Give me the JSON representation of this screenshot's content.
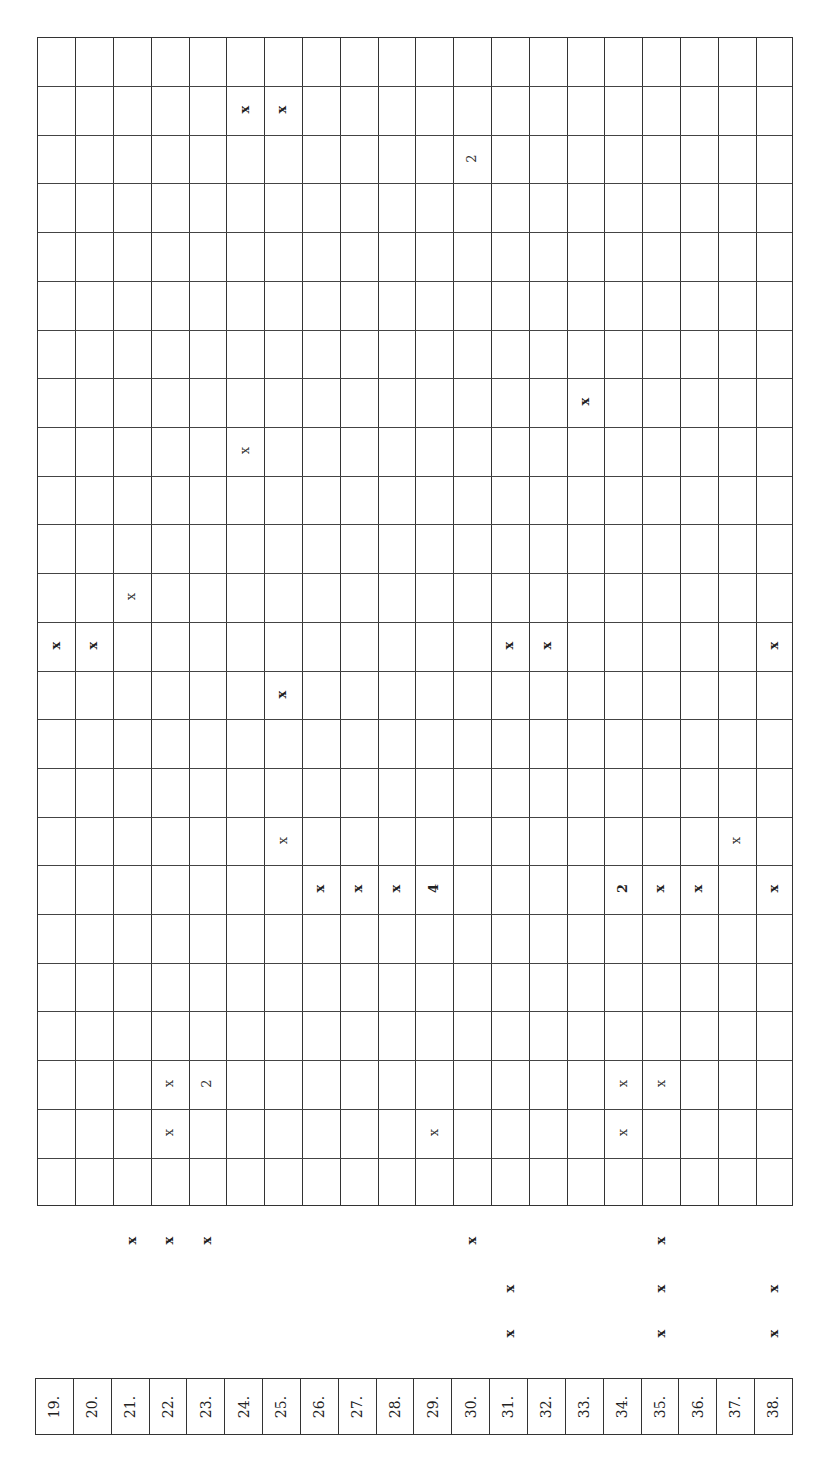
{
  "table": {
    "rows": 24,
    "columns": 20,
    "column_labels": [
      "19.",
      "20.",
      "21.",
      "22.",
      "23.",
      "24.",
      "25.",
      "26.",
      "27.",
      "28.",
      "29.",
      "30.",
      "31.",
      "32.",
      "33.",
      "34.",
      "35.",
      "36.",
      "37.",
      "38."
    ],
    "grid_marks": [
      {
        "row": 1,
        "col": 5,
        "text": "x",
        "weight": "bold"
      },
      {
        "row": 1,
        "col": 6,
        "text": "x",
        "weight": "bold"
      },
      {
        "row": 2,
        "col": 11,
        "text": "2",
        "weight": "light"
      },
      {
        "row": 7,
        "col": 14,
        "text": "x",
        "weight": "bold"
      },
      {
        "row": 8,
        "col": 5,
        "text": "x",
        "weight": "light"
      },
      {
        "row": 11,
        "col": 2,
        "text": "x",
        "weight": "light"
      },
      {
        "row": 12,
        "col": 0,
        "text": "x",
        "weight": "bold"
      },
      {
        "row": 12,
        "col": 1,
        "text": "x",
        "weight": "bold"
      },
      {
        "row": 12,
        "col": 12,
        "text": "x",
        "weight": "bold"
      },
      {
        "row": 12,
        "col": 13,
        "text": "x",
        "weight": "bold"
      },
      {
        "row": 12,
        "col": 19,
        "text": "x",
        "weight": "bold"
      },
      {
        "row": 13,
        "col": 6,
        "text": "x",
        "weight": "bold"
      },
      {
        "row": 16,
        "col": 6,
        "text": "x",
        "weight": "light"
      },
      {
        "row": 16,
        "col": 18,
        "text": "x",
        "weight": "light"
      },
      {
        "row": 17,
        "col": 7,
        "text": "x",
        "weight": "bold"
      },
      {
        "row": 17,
        "col": 8,
        "text": "x",
        "weight": "bold"
      },
      {
        "row": 17,
        "col": 9,
        "text": "x",
        "weight": "bold"
      },
      {
        "row": 17,
        "col": 10,
        "text": "4",
        "weight": "bold"
      },
      {
        "row": 17,
        "col": 15,
        "text": "2",
        "weight": "bold"
      },
      {
        "row": 17,
        "col": 16,
        "text": "x",
        "weight": "bold"
      },
      {
        "row": 17,
        "col": 17,
        "text": "x",
        "weight": "bold"
      },
      {
        "row": 17,
        "col": 19,
        "text": "x",
        "weight": "bold"
      },
      {
        "row": 21,
        "col": 3,
        "text": "x",
        "weight": "light"
      },
      {
        "row": 21,
        "col": 4,
        "text": "2",
        "weight": "light"
      },
      {
        "row": 21,
        "col": 15,
        "text": "x",
        "weight": "light"
      },
      {
        "row": 21,
        "col": 16,
        "text": "x",
        "weight": "light"
      },
      {
        "row": 22,
        "col": 3,
        "text": "x",
        "weight": "light"
      },
      {
        "row": 22,
        "col": 10,
        "text": "x",
        "weight": "light"
      },
      {
        "row": 22,
        "col": 15,
        "text": "x",
        "weight": "light"
      }
    ],
    "outside_marks": [
      {
        "line": 0,
        "col": 2,
        "text": "x"
      },
      {
        "line": 0,
        "col": 3,
        "text": "x"
      },
      {
        "line": 0,
        "col": 4,
        "text": "x"
      },
      {
        "line": 0,
        "col": 11,
        "text": "x"
      },
      {
        "line": 0,
        "col": 16,
        "text": "x"
      },
      {
        "line": 1,
        "col": 12,
        "text": "x"
      },
      {
        "line": 1,
        "col": 16,
        "text": "x"
      },
      {
        "line": 1,
        "col": 19,
        "text": "x"
      },
      {
        "line": 2,
        "col": 12,
        "text": "x"
      },
      {
        "line": 2,
        "col": 16,
        "text": "x"
      },
      {
        "line": 2,
        "col": 19,
        "text": "x"
      }
    ]
  }
}
